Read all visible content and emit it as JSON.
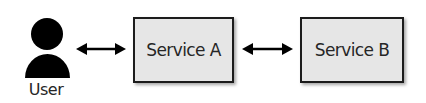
{
  "diagram": {
    "type": "architecture-flow",
    "actor": {
      "label": "User",
      "icon": "user-icon"
    },
    "nodes": [
      {
        "id": "service-a",
        "label": "Service A"
      },
      {
        "id": "service-b",
        "label": "Service B"
      }
    ],
    "edges": [
      {
        "from": "User",
        "to": "Service A",
        "direction": "bidirectional"
      },
      {
        "from": "Service A",
        "to": "Service B",
        "direction": "bidirectional"
      }
    ],
    "colors": {
      "box_fill": "#e6e6e6",
      "box_border": "#1c1c1c",
      "icon": "#000000",
      "arrow": "#000000",
      "text": "#262626"
    }
  }
}
